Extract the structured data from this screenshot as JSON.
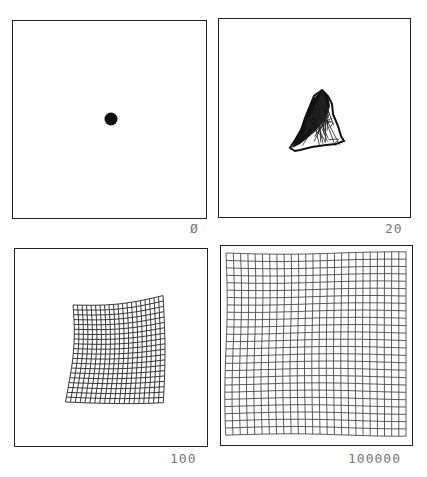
{
  "figure": {
    "panels": [
      {
        "id": "p0",
        "label": "Ø",
        "iteration": 0,
        "state": "all nodes collapsed to a single point"
      },
      {
        "id": "p20",
        "label": "20",
        "iteration": 20,
        "state": "tangled triangular clump"
      },
      {
        "id": "p100",
        "label": "100",
        "iteration": 100,
        "state": "partially unfolded grid, distorted square"
      },
      {
        "id": "p100000",
        "label": "100000",
        "iteration": 100000,
        "state": "fully unfolded regular grid filling square"
      }
    ],
    "colors": {
      "line": "#222222",
      "label": "#777777",
      "background": "#ffffff"
    },
    "grid_size": 25
  }
}
